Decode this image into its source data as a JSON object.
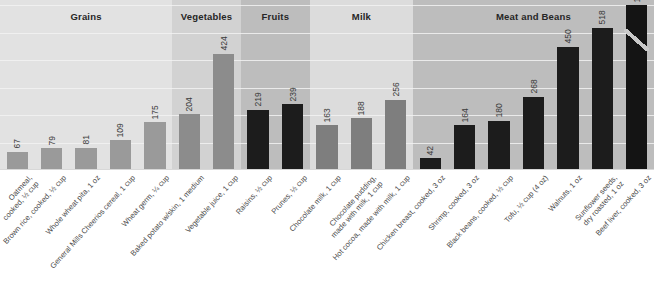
{
  "chart_data": {
    "type": "bar",
    "title": "",
    "subtitle": "",
    "xlabel": "",
    "ylabel": "",
    "ylim": [
      0,
      620
    ],
    "grid": true,
    "legend": "none",
    "value_axis_note": "Bar for Beef liver is broken; true value 12,400 exceeds axis scale",
    "groups": [
      {
        "name": "Grains",
        "start_index": 0,
        "count": 5,
        "band_color": "#e2e2e2"
      },
      {
        "name": "Vegetables",
        "start_index": 5,
        "count": 2,
        "band_color": "#d2d2d2"
      },
      {
        "name": "Fruits",
        "start_index": 7,
        "count": 2,
        "band_color": "#bdbdbd"
      },
      {
        "name": "Milk",
        "start_index": 9,
        "count": 3,
        "band_color": "#dcdcdc"
      },
      {
        "name": "Meat and Beans",
        "start_index": 12,
        "count": 7,
        "band_color": "#bdbdbd"
      }
    ],
    "categories": [
      "Oatmeal,\ncooked, ½ cup",
      "Brown rice, cooked, ½ cup",
      "Whole wheat pita, 1 oz",
      "General Mills Cheerios cereal, 1 cup",
      "Wheat germ, ¼ cup",
      "Baked potato w/skin, 1 medium",
      "Vegetable juice, 1 cup",
      "Raisins, ½ cup",
      "Prunes, ½ cup",
      "Chocolate milk, 1 cup",
      "Chocolate pudding,\nmade with milk, 1 cup",
      "Hot cocoa, made with milk, 1 cup",
      "Chicken breast, cooked, 3 oz",
      "Shrimp, cooked, 3 oz",
      "Black beans, cooked, ½ cup",
      "Tofu, ½ cup (4 oz)",
      "Walnuts, 1 oz",
      "Sunflower seeds,\ndry roasted, 1 oz",
      "Beef liver, cooked, 3 oz"
    ],
    "values": [
      67,
      79,
      81,
      109,
      175,
      204,
      424,
      219,
      239,
      163,
      188,
      256,
      42,
      164,
      180,
      268,
      450,
      518,
      12400
    ],
    "value_labels": [
      "67",
      "79",
      "81",
      "109",
      "175",
      "204",
      "424",
      "219",
      "239",
      "163",
      "188",
      "256",
      "42",
      "164",
      "180",
      "268",
      "450",
      "518",
      "12,400"
    ],
    "plot_values": [
      67,
      79,
      81,
      109,
      175,
      204,
      424,
      219,
      239,
      163,
      188,
      256,
      42,
      164,
      180,
      268,
      450,
      518,
      600
    ],
    "bar_colors": [
      "#9a9a9a",
      "#9a9a9a",
      "#9a9a9a",
      "#9a9a9a",
      "#9a9a9a",
      "#8c8c8c",
      "#8c8c8c",
      "#1c1c1c",
      "#1c1c1c",
      "#7e7e7e",
      "#7e7e7e",
      "#7e7e7e",
      "#1c1c1c",
      "#1c1c1c",
      "#1c1c1c",
      "#1c1c1c",
      "#1c1c1c",
      "#1c1c1c",
      "#141414"
    ],
    "broken_bar_index": 18
  },
  "colors": {
    "background": "#ffffff",
    "gridline": "#f2f2f2",
    "band_light": "#e2e2e2",
    "band_mid": "#dcdcdc",
    "band_dark": "#bdbdbd",
    "bar_gray": "#9a9a9a",
    "bar_dark": "#1c1c1c",
    "label_text": "#4a4a4a",
    "header_text": "#262626"
  }
}
